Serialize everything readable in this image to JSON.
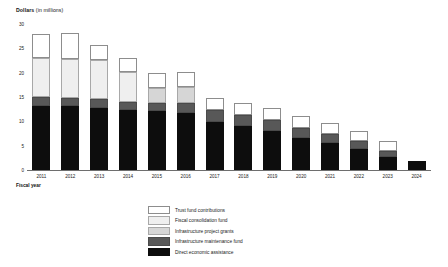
{
  "chart_data": {
    "type": "bar",
    "subtype": "stacked-bar",
    "title": "",
    "ylabel_bold": "Dollars",
    "ylabel_regular": "(in millions)",
    "xlabel": "Fiscal year",
    "ylim": [
      0,
      30
    ],
    "yticks": [
      0,
      5,
      10,
      15,
      20,
      25,
      30
    ],
    "ytick_labels": [
      "0",
      "5",
      "10",
      "15",
      "20",
      "25",
      "30"
    ],
    "grid": false,
    "legend_position": "bottom-center",
    "categories": [
      "2011",
      "2012",
      "2013",
      "2014",
      "2015",
      "2016",
      "2017",
      "2018",
      "2019",
      "2020",
      "2021",
      "2022",
      "2023",
      "2024"
    ],
    "series": [
      {
        "name": "Direct economic assistance",
        "color": "#0d0d0d",
        "values": [
          13.2,
          13.1,
          12.8,
          12.4,
          12.1,
          11.8,
          9.8,
          9.0,
          8.0,
          6.6,
          5.6,
          4.4,
          2.6,
          1.9
        ]
      },
      {
        "name": "Infrastructure maintenance fund",
        "color": "#585858",
        "values": [
          1.8,
          1.8,
          1.8,
          1.5,
          1.7,
          2.0,
          2.5,
          2.4,
          2.2,
          2.1,
          1.8,
          1.5,
          1.3,
          0.0
        ]
      },
      {
        "name": "Infrastructure project grants",
        "color": "#d6d6d6",
        "values": [
          0.0,
          0.0,
          0.0,
          0.0,
          3.0,
          3.3,
          0.0,
          0.0,
          0.0,
          0.0,
          0.0,
          0.0,
          0.0,
          0.0
        ]
      },
      {
        "name": "Fiscal consolidation fund",
        "color": "#efefef",
        "values": [
          8.0,
          8.0,
          8.0,
          6.3,
          0.0,
          0.0,
          0.0,
          0.0,
          0.0,
          0.0,
          0.0,
          0.0,
          0.0,
          0.0
        ]
      },
      {
        "name": "Trust fund contributions",
        "color": "#ffffff",
        "values": [
          5.0,
          5.2,
          3.0,
          2.8,
          3.2,
          3.0,
          2.5,
          2.3,
          2.5,
          2.4,
          2.2,
          2.1,
          2.0,
          0.0
        ]
      }
    ],
    "totals": [
      28.0,
      28.1,
      25.6,
      23.0,
      20.0,
      20.1,
      14.8,
      13.7,
      12.7,
      11.1,
      9.6,
      8.0,
      5.9,
      1.9
    ]
  },
  "legend": {
    "items": [
      {
        "label": "Trust fund contributions",
        "swatch": "#ffffff",
        "border": "#8d8d8d"
      },
      {
        "label": "Fiscal consolidation fund",
        "swatch": "#efefef",
        "border": "#a8a8a8"
      },
      {
        "label": "Infrastructure project grants",
        "swatch": "#d6d6d6",
        "border": "#a8a8a8"
      },
      {
        "label": "Infrastructure maintenance fund",
        "swatch": "#585858",
        "border": "#4a4a4a"
      },
      {
        "label": "Direct economic assistance",
        "swatch": "#0d0d0d",
        "border": "#0d0d0d"
      }
    ]
  }
}
